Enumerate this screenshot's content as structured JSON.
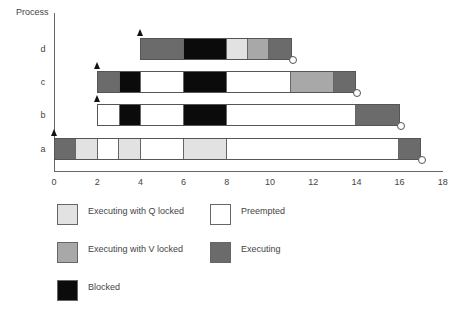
{
  "colors": {
    "executing": "#6b6b6b",
    "executing_v_locked": "#a8a8a8",
    "executing_q_locked": "#e2e2e2",
    "preempted": "#ffffff",
    "blocked": "#0b0b0b"
  },
  "axes": {
    "y_label": "Process",
    "x_ticks": [
      "0",
      "2",
      "4",
      "6",
      "8",
      "10",
      "12",
      "14",
      "16",
      "18"
    ]
  },
  "processes": [
    {
      "name": "d",
      "arrival": 4,
      "finish": 11,
      "segments": [
        {
          "start": 4,
          "end": 6,
          "state": "executing"
        },
        {
          "start": 6,
          "end": 8,
          "state": "blocked"
        },
        {
          "start": 8,
          "end": 9,
          "state": "executing_q_locked"
        },
        {
          "start": 9,
          "end": 10,
          "state": "executing_v_locked"
        },
        {
          "start": 10,
          "end": 11,
          "state": "executing"
        }
      ]
    },
    {
      "name": "c",
      "arrival": 2,
      "finish": 14,
      "segments": [
        {
          "start": 2,
          "end": 3,
          "state": "executing"
        },
        {
          "start": 3,
          "end": 4,
          "state": "blocked"
        },
        {
          "start": 4,
          "end": 6,
          "state": "preempted"
        },
        {
          "start": 6,
          "end": 8,
          "state": "blocked"
        },
        {
          "start": 8,
          "end": 11,
          "state": "preempted"
        },
        {
          "start": 11,
          "end": 13,
          "state": "executing_v_locked"
        },
        {
          "start": 13,
          "end": 14,
          "state": "executing"
        }
      ]
    },
    {
      "name": "b",
      "arrival": 2,
      "finish": 16,
      "segments": [
        {
          "start": 2,
          "end": 3,
          "state": "preempted"
        },
        {
          "start": 3,
          "end": 4,
          "state": "blocked"
        },
        {
          "start": 4,
          "end": 6,
          "state": "preempted"
        },
        {
          "start": 6,
          "end": 8,
          "state": "blocked"
        },
        {
          "start": 8,
          "end": 14,
          "state": "preempted"
        },
        {
          "start": 14,
          "end": 16,
          "state": "executing"
        }
      ]
    },
    {
      "name": "a",
      "arrival": 0,
      "finish": 17,
      "segments": [
        {
          "start": 0,
          "end": 1,
          "state": "executing"
        },
        {
          "start": 1,
          "end": 2,
          "state": "executing_q_locked"
        },
        {
          "start": 2,
          "end": 3,
          "state": "preempted"
        },
        {
          "start": 3,
          "end": 4,
          "state": "executing_q_locked"
        },
        {
          "start": 4,
          "end": 6,
          "state": "preempted"
        },
        {
          "start": 6,
          "end": 8,
          "state": "executing_q_locked"
        },
        {
          "start": 8,
          "end": 16,
          "state": "preempted"
        },
        {
          "start": 16,
          "end": 17,
          "state": "executing"
        }
      ]
    }
  ],
  "legend": [
    {
      "state": "executing_q_locked",
      "label": "Executing with Q locked"
    },
    {
      "state": "preempted",
      "label": "Preempted"
    },
    {
      "state": "executing_v_locked",
      "label": "Executing with V locked"
    },
    {
      "state": "executing",
      "label": "Executing"
    },
    {
      "state": "blocked",
      "label": "Blocked"
    }
  ]
}
